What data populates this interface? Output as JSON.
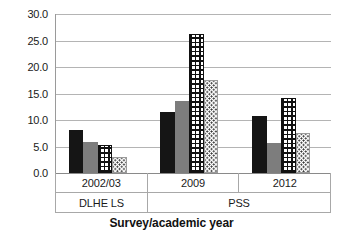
{
  "chart_data": {
    "type": "bar",
    "title": "",
    "xlabel": "Survey/academic year",
    "ylabel": "",
    "categories": [
      "2002/03",
      "2009",
      "2012"
    ],
    "group_labels": [
      {
        "label": "DLHE LS",
        "span": 1
      },
      {
        "label": "PSS",
        "span": 2
      }
    ],
    "series": [
      {
        "name": "series-1",
        "style": "solid-dark",
        "values": [
          8.1,
          11.5,
          10.7
        ]
      },
      {
        "name": "series-2",
        "style": "solid-gray",
        "values": [
          5.9,
          13.5,
          5.6
        ]
      },
      {
        "name": "series-3",
        "style": "crosshatch",
        "values": [
          5.2,
          26.3,
          14.2
        ]
      },
      {
        "name": "series-4",
        "style": "dotted",
        "values": [
          3.1,
          17.5,
          7.5
        ]
      }
    ],
    "ylim": [
      0.0,
      30.0
    ],
    "ytick_step": 5.0,
    "ytick_labels": [
      "30.0",
      "25.0",
      "20.0",
      "15.0",
      "10.0",
      "5.0",
      "0.0"
    ],
    "ytick_values": [
      30.0,
      25.0,
      20.0,
      15.0,
      10.0,
      5.0,
      0.0
    ],
    "grid": true,
    "legend": "none",
    "colors": {
      "solid_dark": "#151515",
      "solid_gray": "#7d7d7d",
      "pattern_ink": "#111111",
      "gridline": "#b4b4b4",
      "axis": "#8a8a8a",
      "text": "#1a1a1a",
      "background": "#ffffff"
    }
  }
}
